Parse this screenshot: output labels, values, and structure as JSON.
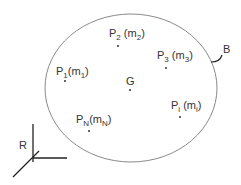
{
  "diagram": {
    "type": "rigid body with particles",
    "body_label": "B",
    "center_of_mass_label": "G",
    "reference_frame_label": "R",
    "colors": {
      "outline": "#8a8a8a",
      "axes": "#222222",
      "text": "#333333",
      "points": "#333333"
    },
    "particles": [
      {
        "id": "P1",
        "point": "P",
        "point_sub": "1",
        "mass": "m",
        "mass_sub": "1"
      },
      {
        "id": "P2",
        "point": "P",
        "point_sub": "2",
        "mass": "m",
        "mass_sub": "2"
      },
      {
        "id": "P3",
        "point": "P",
        "point_sub": "3",
        "mass": "m",
        "mass_sub": "3"
      },
      {
        "id": "Pi",
        "point": "P",
        "point_sub": "i",
        "mass": "m",
        "mass_sub": "i"
      },
      {
        "id": "PN",
        "point": "P",
        "point_sub": "N",
        "mass": "m",
        "mass_sub": "N"
      }
    ]
  }
}
